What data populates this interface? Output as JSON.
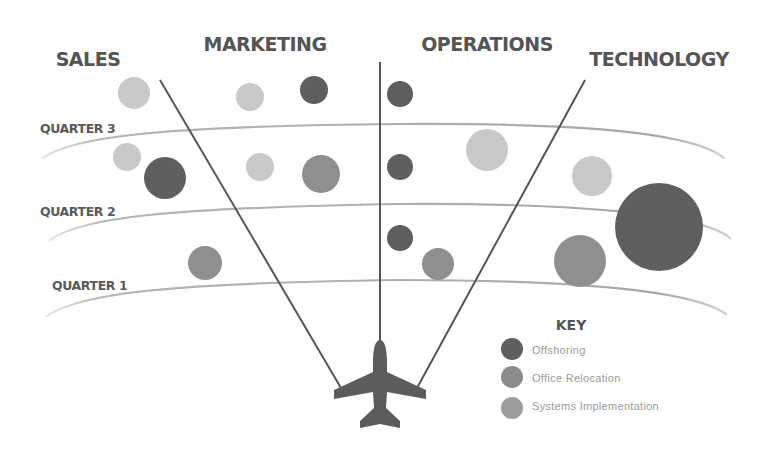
{
  "departments": [
    {
      "label": "SALES",
      "x": 88,
      "y": 66
    },
    {
      "label": "MARKETING",
      "x": 265,
      "y": 51
    },
    {
      "label": "OPERATIONS",
      "x": 487,
      "y": 51
    },
    {
      "label": "TECHNOLOGY",
      "x": 659,
      "y": 66
    }
  ],
  "quarters": [
    {
      "label": "QUARTER 3",
      "x": 40,
      "y": 133
    },
    {
      "label": "QUARTER 2",
      "x": 40,
      "y": 216
    },
    {
      "label": "QUARTER 1",
      "x": 52,
      "y": 290
    }
  ],
  "key": {
    "title": "KEY",
    "items": [
      {
        "label": "Offshoring",
        "color": "#5f5f5f"
      },
      {
        "label": "Office Relocation",
        "color": "#8c8c8c"
      },
      {
        "label": "Systems Implementation",
        "color": "#9c9c9c"
      }
    ]
  },
  "colors": {
    "dark": "#5f5f5f",
    "mid": "#8f8f8f",
    "light": "#c9c9c9",
    "line": "#555555",
    "arc": "#a8a8a8",
    "plane": "#5c5c5c"
  },
  "chart_data": {
    "type": "bubble",
    "title": "",
    "categories": [
      "Sales",
      "Marketing",
      "Operations",
      "Technology"
    ],
    "rows": [
      "Quarter 1",
      "Quarter 2",
      "Quarter 3"
    ],
    "legend": [
      "Offshoring",
      "Office Relocation",
      "Systems Implementation"
    ],
    "legend_title": "KEY",
    "legend_position": "bottom-right",
    "points": [
      {
        "department": "Sales",
        "quarter": "Above Quarter 3",
        "type": "Systems Implementation",
        "size": 16
      },
      {
        "department": "Sales",
        "quarter": "Quarter 3",
        "type": "Systems Implementation",
        "size": 14
      },
      {
        "department": "Sales",
        "quarter": "Quarter 3",
        "type": "Offshoring",
        "size": 21
      },
      {
        "department": "Sales",
        "quarter": "Quarter 2",
        "type": "Office Relocation",
        "size": 17
      },
      {
        "department": "Marketing",
        "quarter": "Above Quarter 3",
        "type": "Systems Implementation",
        "size": 14
      },
      {
        "department": "Marketing",
        "quarter": "Above Quarter 3",
        "type": "Offshoring",
        "size": 14
      },
      {
        "department": "Marketing",
        "quarter": "Quarter 3",
        "type": "Systems Implementation",
        "size": 14
      },
      {
        "department": "Marketing",
        "quarter": "Quarter 3",
        "type": "Office Relocation",
        "size": 19
      },
      {
        "department": "Operations",
        "quarter": "Above Quarter 3",
        "type": "Offshoring",
        "size": 13
      },
      {
        "department": "Operations",
        "quarter": "Quarter 3",
        "type": "Offshoring",
        "size": 13
      },
      {
        "department": "Operations",
        "quarter": "Quarter 3",
        "type": "Systems Implementation",
        "size": 21
      },
      {
        "department": "Operations",
        "quarter": "Quarter 2",
        "type": "Offshoring",
        "size": 13
      },
      {
        "department": "Operations",
        "quarter": "Quarter 2",
        "type": "Office Relocation",
        "size": 16
      },
      {
        "department": "Technology",
        "quarter": "Quarter 3",
        "type": "Systems Implementation",
        "size": 20
      },
      {
        "department": "Technology",
        "quarter": "Quarter 2",
        "type": "Office Relocation",
        "size": 26
      },
      {
        "department": "Technology",
        "quarter": "Quarter 2",
        "type": "Offshoring",
        "size": 44
      }
    ],
    "grid": false,
    "xlabel": "",
    "ylabel": ""
  },
  "bubbles": [
    {
      "cx": 134,
      "cy": 93,
      "r": 16,
      "shade": "light"
    },
    {
      "cx": 127,
      "cy": 157,
      "r": 14,
      "shade": "light"
    },
    {
      "cx": 165,
      "cy": 178,
      "r": 21,
      "shade": "dark"
    },
    {
      "cx": 205,
      "cy": 263,
      "r": 17,
      "shade": "mid"
    },
    {
      "cx": 250,
      "cy": 97,
      "r": 14,
      "shade": "light"
    },
    {
      "cx": 314,
      "cy": 90,
      "r": 14,
      "shade": "dark"
    },
    {
      "cx": 260,
      "cy": 167,
      "r": 14,
      "shade": "light"
    },
    {
      "cx": 321,
      "cy": 174,
      "r": 19,
      "shade": "mid"
    },
    {
      "cx": 400,
      "cy": 94,
      "r": 13,
      "shade": "dark"
    },
    {
      "cx": 400,
      "cy": 167,
      "r": 13,
      "shade": "dark"
    },
    {
      "cx": 487,
      "cy": 150,
      "r": 21,
      "shade": "light"
    },
    {
      "cx": 400,
      "cy": 238,
      "r": 13,
      "shade": "dark"
    },
    {
      "cx": 438,
      "cy": 264,
      "r": 16,
      "shade": "mid"
    },
    {
      "cx": 592,
      "cy": 176,
      "r": 20,
      "shade": "light"
    },
    {
      "cx": 580,
      "cy": 261,
      "r": 26,
      "shade": "mid"
    },
    {
      "cx": 659,
      "cy": 227,
      "r": 44,
      "shade": "dark"
    }
  ]
}
